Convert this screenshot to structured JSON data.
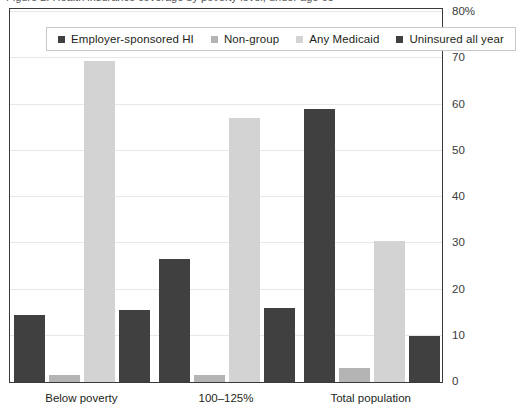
{
  "caption": {
    "text": "Figure 2. Health insurance coverage by poverty level, under age 65"
  },
  "legend": {
    "items": [
      {
        "label": "Employer-sponsored HI",
        "color": "#404040"
      },
      {
        "label": "Non-group",
        "color": "#b4b4b4"
      },
      {
        "label": "Any Medicaid",
        "color": "#d3d3d3"
      },
      {
        "label": "Uninsured all year",
        "color": "#404040"
      }
    ]
  },
  "chart_data": {
    "type": "bar",
    "title": "",
    "xlabel": "",
    "ylabel": "",
    "ylim": [
      0,
      80
    ],
    "yticks": [
      "0",
      "10",
      "20",
      "30",
      "40",
      "50",
      "60",
      "70",
      "80%"
    ],
    "ytick_values": [
      0,
      10,
      20,
      30,
      40,
      50,
      60,
      70,
      80
    ],
    "grid": true,
    "legend_position": "top-inside",
    "categories": [
      "Below poverty",
      "100–125%",
      "Total population"
    ],
    "series": [
      {
        "name": "Employer-sponsored HI",
        "color": "#404040",
        "values": [
          14.5,
          26.5,
          59
        ]
      },
      {
        "name": "Non-group",
        "color": "#b4b4b4",
        "values": [
          1.5,
          1.5,
          3
        ]
      },
      {
        "name": "Any Medicaid",
        "color": "#d3d3d3",
        "values": [
          69.5,
          57,
          30.5
        ]
      },
      {
        "name": "Uninsured all year",
        "color": "#404040",
        "values": [
          15.5,
          16,
          10
        ]
      }
    ]
  }
}
